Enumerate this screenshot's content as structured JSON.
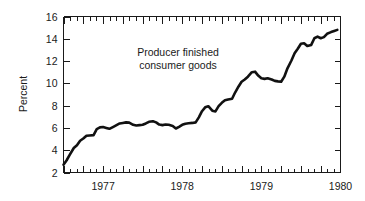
{
  "chart_data": {
    "type": "line",
    "title": "",
    "xlabel": "",
    "ylabel": "Percent",
    "annotation_line1": "Producer finished",
    "annotation_line2": "consumer goods",
    "legend": [],
    "grid": false,
    "ylim": [
      2,
      16
    ],
    "yticks": [
      2,
      4,
      6,
      8,
      10,
      12,
      14,
      16
    ],
    "ytick_labels": [
      "2",
      "4",
      "6",
      "8",
      "10",
      "12",
      "14",
      "16"
    ],
    "xlim": [
      1976.5,
      1980.0
    ],
    "xticks": [
      1977,
      1978,
      1979,
      1980
    ],
    "xtick_labels": [
      "1977",
      "1978",
      "1979",
      "1980"
    ],
    "x_minor_tick_interval_years": 0.0833,
    "line_color": "#111111",
    "background_color": "#ffffff",
    "axis_color": "#1a1a1a",
    "series": [
      {
        "name": "Producer finished consumer goods",
        "x": [
          1976.5,
          1976.583,
          1976.667,
          1976.75,
          1976.833,
          1976.917,
          1977.0,
          1977.083,
          1977.167,
          1977.25,
          1977.333,
          1977.417,
          1977.5,
          1977.583,
          1977.667,
          1977.75,
          1977.833,
          1977.917,
          1978.0,
          1978.083,
          1978.167,
          1978.25,
          1978.333,
          1978.417,
          1978.5,
          1978.583,
          1978.667,
          1978.75,
          1978.833,
          1978.917,
          1979.0,
          1979.083,
          1979.167,
          1979.25,
          1979.333,
          1979.417,
          1979.5,
          1979.583,
          1979.667,
          1979.75,
          1979.833,
          1979.917
        ],
        "values": [
          2.7,
          3.6,
          4.4,
          5.0,
          5.3,
          5.35,
          6.0,
          6.05,
          5.9,
          6.2,
          6.4,
          6.5,
          6.3,
          6.25,
          6.3,
          6.55,
          6.6,
          6.35,
          6.2,
          6.3,
          6.2,
          5.95,
          6.3,
          6.4,
          6.45,
          6.5,
          7.2,
          7.9,
          7.5,
          8.2,
          8.5,
          8.6,
          9.5,
          10.2,
          10.6,
          11.05,
          10.5,
          10.4,
          10.2,
          10.15,
          11.3,
          12.7
        ]
      }
    ],
    "series_tail": {
      "x": [
        1979.917,
        1980.0
      ],
      "values": [
        12.7,
        14.8
      ]
    },
    "data_points_extended": [
      [
        1976.5,
        2.7
      ],
      [
        1976.54,
        3.1
      ],
      [
        1976.58,
        3.6
      ],
      [
        1976.63,
        4.2
      ],
      [
        1976.67,
        4.45
      ],
      [
        1976.71,
        4.85
      ],
      [
        1976.75,
        5.05
      ],
      [
        1976.79,
        5.3
      ],
      [
        1976.83,
        5.32
      ],
      [
        1976.88,
        5.35
      ],
      [
        1976.92,
        5.9
      ],
      [
        1976.96,
        6.05
      ],
      [
        1977.0,
        6.08
      ],
      [
        1977.04,
        6.0
      ],
      [
        1977.08,
        5.92
      ],
      [
        1977.13,
        6.1
      ],
      [
        1977.17,
        6.25
      ],
      [
        1977.21,
        6.4
      ],
      [
        1977.25,
        6.45
      ],
      [
        1977.29,
        6.5
      ],
      [
        1977.33,
        6.48
      ],
      [
        1977.38,
        6.28
      ],
      [
        1977.42,
        6.22
      ],
      [
        1977.46,
        6.25
      ],
      [
        1977.5,
        6.28
      ],
      [
        1977.54,
        6.4
      ],
      [
        1977.58,
        6.55
      ],
      [
        1977.63,
        6.6
      ],
      [
        1977.67,
        6.5
      ],
      [
        1977.71,
        6.3
      ],
      [
        1977.75,
        6.25
      ],
      [
        1977.79,
        6.3
      ],
      [
        1977.83,
        6.28
      ],
      [
        1977.88,
        6.18
      ],
      [
        1977.92,
        5.95
      ],
      [
        1977.96,
        6.1
      ],
      [
        1978.0,
        6.28
      ],
      [
        1978.04,
        6.38
      ],
      [
        1978.08,
        6.42
      ],
      [
        1978.13,
        6.45
      ],
      [
        1978.17,
        6.5
      ],
      [
        1978.21,
        6.95
      ],
      [
        1978.25,
        7.5
      ],
      [
        1978.29,
        7.85
      ],
      [
        1978.33,
        7.95
      ],
      [
        1978.38,
        7.55
      ],
      [
        1978.42,
        7.48
      ],
      [
        1978.46,
        7.95
      ],
      [
        1978.5,
        8.25
      ],
      [
        1978.54,
        8.48
      ],
      [
        1978.58,
        8.55
      ],
      [
        1978.63,
        8.62
      ],
      [
        1978.67,
        9.2
      ],
      [
        1978.71,
        9.7
      ],
      [
        1978.75,
        10.15
      ],
      [
        1978.79,
        10.35
      ],
      [
        1978.83,
        10.6
      ],
      [
        1978.88,
        11.0
      ],
      [
        1978.92,
        11.05
      ],
      [
        1978.96,
        10.7
      ],
      [
        1979.0,
        10.45
      ],
      [
        1979.04,
        10.4
      ],
      [
        1979.08,
        10.45
      ],
      [
        1979.13,
        10.35
      ],
      [
        1979.17,
        10.22
      ],
      [
        1979.21,
        10.18
      ],
      [
        1979.25,
        10.15
      ],
      [
        1979.29,
        10.6
      ],
      [
        1979.33,
        11.35
      ],
      [
        1979.38,
        12.05
      ],
      [
        1979.42,
        12.7
      ],
      [
        1979.46,
        13.1
      ],
      [
        1979.5,
        13.55
      ],
      [
        1979.54,
        13.6
      ],
      [
        1979.58,
        13.35
      ],
      [
        1979.63,
        13.45
      ],
      [
        1979.67,
        14.05
      ],
      [
        1979.71,
        14.2
      ],
      [
        1979.75,
        14.05
      ],
      [
        1979.79,
        14.15
      ],
      [
        1979.83,
        14.45
      ],
      [
        1979.88,
        14.6
      ],
      [
        1979.92,
        14.7
      ],
      [
        1979.96,
        14.8
      ]
    ]
  }
}
